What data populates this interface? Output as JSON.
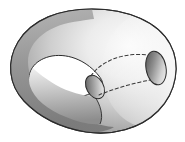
{
  "figure": {
    "title": "Immersed genus surface with handle",
    "type": "mathematical-surface-diagram",
    "background_color": "#ffffff",
    "outline_color": "#2b2b2b",
    "width": 185,
    "height": 142
  },
  "palette": {
    "body_light": "#f2f2f2",
    "body_mid": "#b9b9b9",
    "body_dark": "#6f6f6f",
    "band_dark": "#8a8a8a",
    "band_darker": "#767676",
    "hole_fill": "#ffffff",
    "ellipse_dark": "#555555",
    "ellipse_light": "#e6e6e6",
    "dashed_line": "#3a3a3a",
    "stroke": "#2b2b2b"
  },
  "parts": [
    {
      "name": "outer-body",
      "label": "Outer ovoid body",
      "shading": "radial gradient, light at upper-right, dark toward lower-left rim"
    },
    {
      "name": "left-hole",
      "label": "Teardrop through-hole (left)",
      "fill": "#ffffff",
      "shape": "lens / teardrop narrowing to the right"
    },
    {
      "name": "handle-tube",
      "label": "Tubular handle crossing the body",
      "shading": "linear gradient light top to dark bottom"
    },
    {
      "name": "middle-opening",
      "label": "Small elliptical opening (tube mouth)",
      "cx": 95,
      "cy": 87,
      "rx": 8,
      "ry": 12,
      "rotation_deg": -28
    },
    {
      "name": "right-opening",
      "label": "Large elliptical opening (right)",
      "cx": 156,
      "cy": 68,
      "rx": 10,
      "ry": 17,
      "rotation_deg": -12
    },
    {
      "name": "hidden-upper-curve",
      "label": "Dashed hidden edge (upper)",
      "style": "dashed"
    },
    {
      "name": "hidden-lower-curve",
      "label": "Dashed hidden edge (lower)",
      "style": "dashed"
    }
  ]
}
